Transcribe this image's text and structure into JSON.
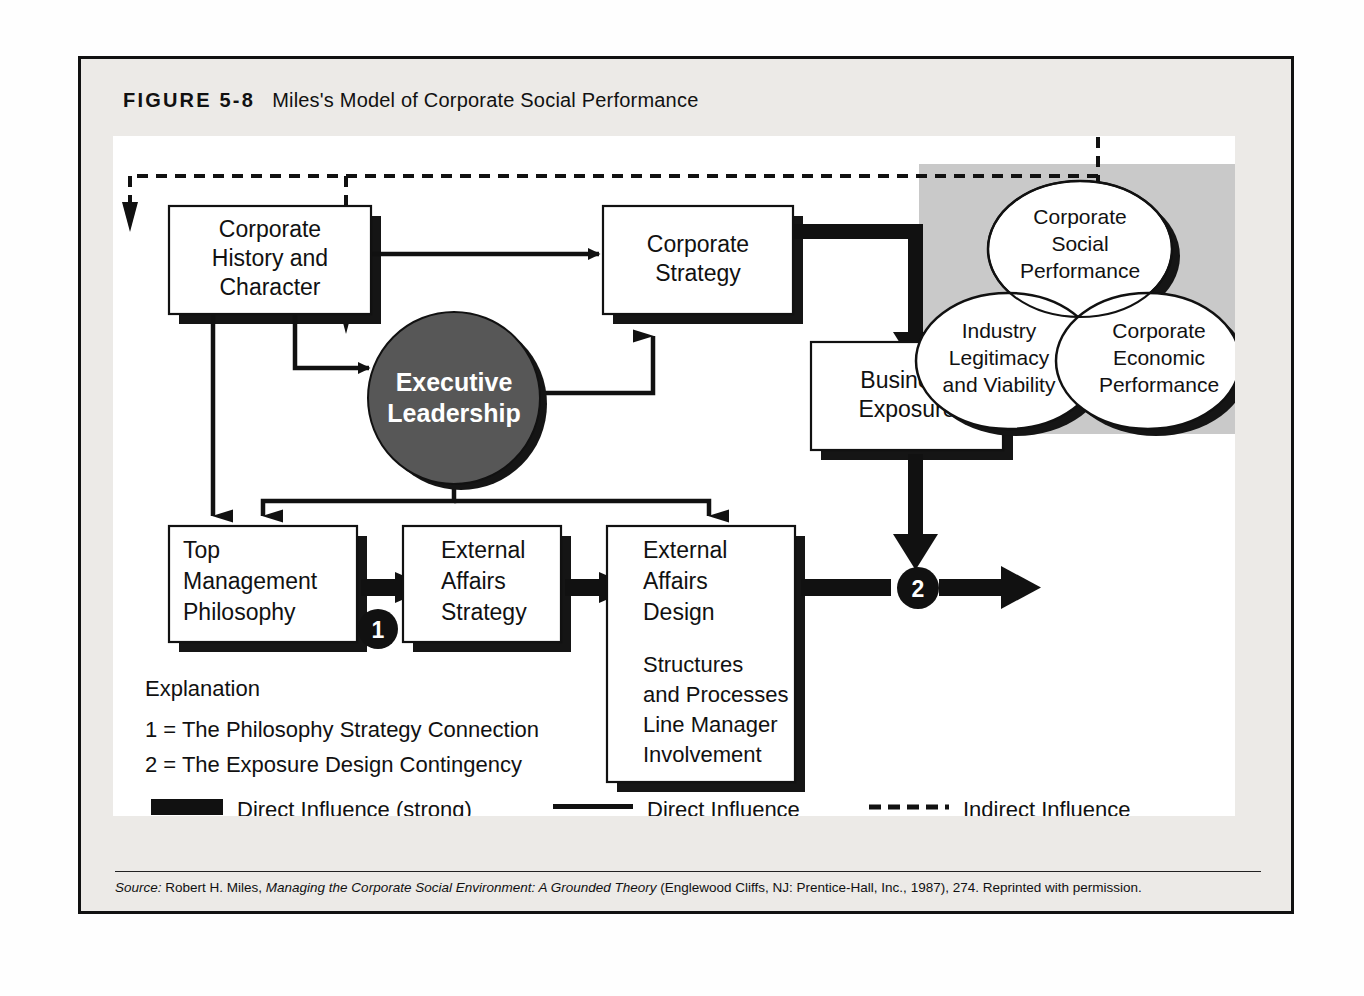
{
  "figure": {
    "number": "FIGURE 5-8",
    "title": "Miles's Model of Corporate Social Performance"
  },
  "nodes": {
    "corporate_history": "Corporate\nHistory and\nCharacter",
    "corporate_history_lines": [
      "Corporate",
      "History and",
      "Character"
    ],
    "executive_leadership_lines": [
      "Executive",
      "Leadership"
    ],
    "corporate_strategy_lines": [
      "Corporate",
      "Strategy"
    ],
    "business_exposure_lines": [
      "Business",
      "Exposure"
    ],
    "top_management_lines": [
      "Top",
      "Management",
      "Philosophy"
    ],
    "external_affairs_strategy_lines": [
      "External",
      "Affairs",
      "Strategy"
    ],
    "external_affairs_design_lines": [
      "External",
      "Affairs",
      "Design"
    ],
    "external_affairs_design_detail_lines": [
      "Structures",
      "and Processes",
      "Line Manager",
      "Involvement"
    ],
    "csp_lines": [
      "Corporate",
      "Social",
      "Performance"
    ],
    "industry_lines": [
      "Industry",
      "Legitimacy",
      "and Viability"
    ],
    "cep_lines": [
      "Corporate",
      "Economic",
      "Performance"
    ]
  },
  "markers": {
    "one": "1",
    "two": "2"
  },
  "explanation": {
    "heading": "Explanation",
    "items": [
      "1 = The Philosophy Strategy Connection",
      "2 = The Exposure Design Contingency"
    ]
  },
  "legend": {
    "items": [
      {
        "label": "Direct Influence (strong)",
        "style": "thick-bar"
      },
      {
        "label": "Direct Influence",
        "style": "thin-line"
      },
      {
        "label": "Indirect Influence",
        "style": "dashed-line"
      }
    ]
  },
  "source": {
    "prefix": "Source:",
    "author": " Robert H. Miles, ",
    "work": "Managing the Corporate Social Environment: A Grounded Theory",
    "suffix": " (Englewood Cliffs, NJ: Prentice-Hall, Inc., 1987), 274. Reprinted with permission."
  },
  "colors": {
    "ink": "#111111",
    "shadow": "#1a1a1a",
    "circle_fill": "#575757",
    "panel_gray": "#c9c9c9",
    "frame_band": "#eceae7"
  }
}
